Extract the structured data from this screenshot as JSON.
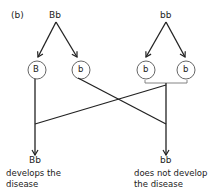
{
  "panel_label": "(b)",
  "parents": {
    "left": "Bb",
    "right": "bb"
  },
  "gametes": {
    "left": [
      "B",
      "b"
    ],
    "right": [
      "b",
      "b"
    ]
  },
  "offspring": [
    {
      "genotype": "Bb",
      "caption": [
        "develops the",
        "disease"
      ]
    },
    {
      "genotype": "bb",
      "caption": [
        "does not develop",
        "the disease"
      ]
    }
  ]
}
